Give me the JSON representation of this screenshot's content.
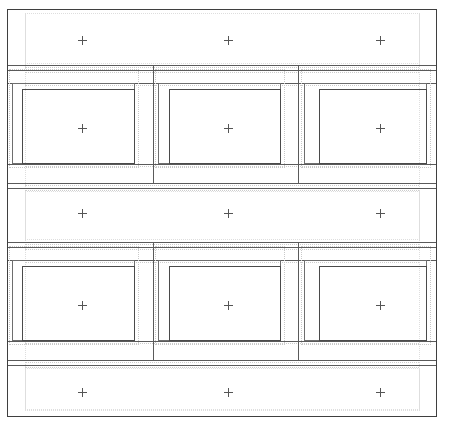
{
  "document": {
    "title": "Layout Wireframe",
    "width": 461,
    "height": 430,
    "background_color": "#ffffff",
    "stroke_color_solid": "#4a4a4a",
    "stroke_color_guide": "#c9c9c9",
    "marker_color": "#555555",
    "marker_glyph": "+"
  },
  "frame": {
    "label": "page-frame",
    "x": 7,
    "y": 9,
    "width": 430,
    "height": 408
  },
  "bands": [
    {
      "id": "band-1",
      "kind": "spacer",
      "label": "",
      "x": 8,
      "y": 10,
      "width": 428,
      "height": 54,
      "marker_count": 3
    },
    {
      "id": "band-2",
      "kind": "content-row",
      "label": "",
      "x": 8,
      "y": 66,
      "width": 428,
      "height": 117,
      "marker_count": 3
    },
    {
      "id": "band-3",
      "kind": "spacer",
      "label": "",
      "x": 8,
      "y": 185,
      "width": 428,
      "height": 56,
      "marker_count": 3
    },
    {
      "id": "band-4",
      "kind": "content-row",
      "label": "",
      "x": 8,
      "y": 243,
      "width": 428,
      "height": 117,
      "marker_count": 3
    },
    {
      "id": "band-5",
      "kind": "spacer",
      "label": "",
      "x": 8,
      "y": 362,
      "width": 428,
      "height": 54,
      "marker_count": 3
    }
  ],
  "columns": [
    {
      "id": "col-1",
      "label": "",
      "x": 8,
      "width": 145
    },
    {
      "id": "col-2",
      "label": "",
      "x": 153,
      "width": 145
    },
    {
      "id": "col-3",
      "label": "",
      "x": 298,
      "width": 138
    }
  ],
  "cells": [
    {
      "id": "cell-r1c1",
      "row": 1,
      "col": 1,
      "outer": {
        "x": 12,
        "y": 83,
        "width": 123,
        "height": 81
      },
      "inner": {
        "x": 22,
        "y": 89,
        "width": 113,
        "height": 75
      },
      "guide": {
        "x": 9,
        "y": 69,
        "width": 130,
        "height": 99
      },
      "marker": {
        "x": 82,
        "y": 128
      }
    },
    {
      "id": "cell-r1c2",
      "row": 1,
      "col": 2,
      "outer": {
        "x": 158,
        "y": 83,
        "width": 123,
        "height": 81
      },
      "inner": {
        "x": 169,
        "y": 89,
        "width": 112,
        "height": 75
      },
      "guide": {
        "x": 155,
        "y": 69,
        "width": 130,
        "height": 99
      },
      "marker": {
        "x": 228,
        "y": 128
      }
    },
    {
      "id": "cell-r1c3",
      "row": 1,
      "col": 3,
      "outer": {
        "x": 304,
        "y": 83,
        "width": 123,
        "height": 81
      },
      "inner": {
        "x": 319,
        "y": 89,
        "width": 108,
        "height": 75
      },
      "guide": {
        "x": 301,
        "y": 69,
        "width": 130,
        "height": 99
      },
      "marker": {
        "x": 380,
        "y": 128
      }
    },
    {
      "id": "cell-r2c1",
      "row": 2,
      "col": 1,
      "outer": {
        "x": 12,
        "y": 260,
        "width": 123,
        "height": 81
      },
      "inner": {
        "x": 22,
        "y": 266,
        "width": 113,
        "height": 75
      },
      "guide": {
        "x": 9,
        "y": 246,
        "width": 130,
        "height": 99
      },
      "marker": {
        "x": 82,
        "y": 305
      }
    },
    {
      "id": "cell-r2c2",
      "row": 2,
      "col": 2,
      "outer": {
        "x": 158,
        "y": 260,
        "width": 123,
        "height": 81
      },
      "inner": {
        "x": 169,
        "y": 266,
        "width": 112,
        "height": 75
      },
      "guide": {
        "x": 155,
        "y": 246,
        "width": 130,
        "height": 99
      },
      "marker": {
        "x": 228,
        "y": 305
      }
    },
    {
      "id": "cell-r2c3",
      "row": 2,
      "col": 3,
      "outer": {
        "x": 304,
        "y": 260,
        "width": 123,
        "height": 81
      },
      "inner": {
        "x": 319,
        "y": 266,
        "width": 108,
        "height": 75
      },
      "guide": {
        "x": 301,
        "y": 246,
        "width": 130,
        "height": 99
      },
      "marker": {
        "x": 380,
        "y": 305
      }
    }
  ],
  "markers": [
    {
      "id": "marker-b1-1",
      "x": 82,
      "y": 40,
      "glyph": "+"
    },
    {
      "id": "marker-b1-2",
      "x": 228,
      "y": 40,
      "glyph": "+"
    },
    {
      "id": "marker-b1-3",
      "x": 380,
      "y": 40,
      "glyph": "+"
    },
    {
      "id": "marker-b2-1",
      "x": 82,
      "y": 128,
      "glyph": "+"
    },
    {
      "id": "marker-b2-2",
      "x": 228,
      "y": 128,
      "glyph": "+"
    },
    {
      "id": "marker-b2-3",
      "x": 380,
      "y": 128,
      "glyph": "+"
    },
    {
      "id": "marker-b3-1",
      "x": 82,
      "y": 213,
      "glyph": "+"
    },
    {
      "id": "marker-b3-2",
      "x": 228,
      "y": 213,
      "glyph": "+"
    },
    {
      "id": "marker-b3-3",
      "x": 380,
      "y": 213,
      "glyph": "+"
    },
    {
      "id": "marker-b4-1",
      "x": 82,
      "y": 305,
      "glyph": "+"
    },
    {
      "id": "marker-b4-2",
      "x": 228,
      "y": 305,
      "glyph": "+"
    },
    {
      "id": "marker-b4-3",
      "x": 380,
      "y": 305,
      "glyph": "+"
    },
    {
      "id": "marker-b5-1",
      "x": 82,
      "y": 392,
      "glyph": "+"
    },
    {
      "id": "marker-b5-2",
      "x": 228,
      "y": 392,
      "glyph": "+"
    },
    {
      "id": "marker-b5-3",
      "x": 380,
      "y": 392,
      "glyph": "+"
    }
  ],
  "rules": {
    "horizontal_solid": [
      {
        "id": "rule-h-1",
        "x": 8,
        "y": 65,
        "width": 428
      },
      {
        "id": "rule-h-2",
        "x": 8,
        "y": 70,
        "width": 428
      },
      {
        "id": "rule-h-3",
        "x": 8,
        "y": 83,
        "width": 428
      },
      {
        "id": "rule-h-4",
        "x": 8,
        "y": 164,
        "width": 428
      },
      {
        "id": "rule-h-5",
        "x": 8,
        "y": 183,
        "width": 428
      },
      {
        "id": "rule-h-6",
        "x": 8,
        "y": 188,
        "width": 428
      },
      {
        "id": "rule-h-7",
        "x": 8,
        "y": 242,
        "width": 428
      },
      {
        "id": "rule-h-8",
        "x": 8,
        "y": 247,
        "width": 428
      },
      {
        "id": "rule-h-9",
        "x": 8,
        "y": 260,
        "width": 428
      },
      {
        "id": "rule-h-10",
        "x": 8,
        "y": 341,
        "width": 428
      },
      {
        "id": "rule-h-11",
        "x": 8,
        "y": 360,
        "width": 428
      },
      {
        "id": "rule-h-12",
        "x": 8,
        "y": 365,
        "width": 428
      }
    ],
    "vertical_solid": [
      {
        "id": "rule-v-1",
        "x": 153,
        "y": 66,
        "height": 117
      },
      {
        "id": "rule-v-2",
        "x": 298,
        "y": 66,
        "height": 117
      },
      {
        "id": "rule-v-3",
        "x": 153,
        "y": 243,
        "height": 117
      },
      {
        "id": "rule-v-4",
        "x": 298,
        "y": 243,
        "height": 117
      }
    ]
  }
}
